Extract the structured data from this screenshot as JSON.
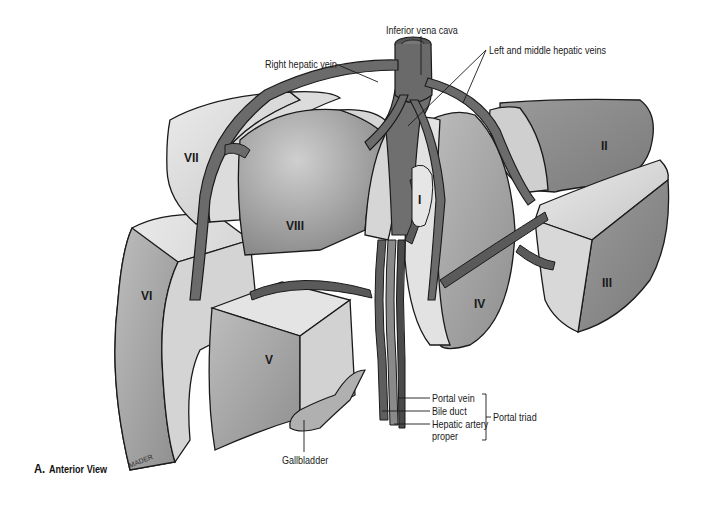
{
  "figure": {
    "caption_letter": "A.",
    "caption_title": "Anterior View",
    "artist_signature": "MADER"
  },
  "labels": {
    "inferior_vena_cava": "Inferior vena cava",
    "right_hepatic_vein": "Right hepatic vein",
    "left_middle_hepatic_veins": "Left and middle hepatic veins",
    "portal_vein": "Portal vein",
    "bile_duct": "Bile duct",
    "hepatic_artery_line1": "Hepatic artery",
    "hepatic_artery_line2": "proper",
    "portal_triad": "Portal triad",
    "gallbladder": "Gallbladder"
  },
  "segments": {
    "I": "I",
    "II": "II",
    "III": "III",
    "IV": "IV",
    "V": "V",
    "VI": "VI",
    "VII": "VII",
    "VIII": "VIII"
  },
  "colors": {
    "background": "#ffffff",
    "vessel_dark": "#6b6b6b",
    "lobe_light": "#d8d8d8",
    "lobe_mid": "#a9a9a9",
    "lobe_dark": "#8c8c8c",
    "outline": "#1a1a1a"
  }
}
